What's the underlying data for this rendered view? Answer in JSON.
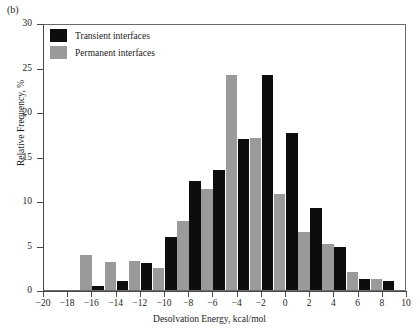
{
  "panel": {
    "label": "(b)"
  },
  "colors": {
    "transient": "#0d0d0d",
    "permanent": "#9a9a9a",
    "axis": "#4a4a4a",
    "frame": "#6b6b6b",
    "background": "#ffffff"
  },
  "legend": {
    "items": [
      {
        "label": "Transient interfaces",
        "color": "#0d0d0d",
        "swatch_name": "legend-swatch-transient"
      },
      {
        "label": "Permanent interfaces",
        "color": "#9a9a9a",
        "swatch_name": "legend-swatch-permanent"
      }
    ]
  },
  "axes": {
    "y": {
      "title": "Relative Frequency, %",
      "ticks": [
        0,
        5,
        10,
        15,
        20,
        25,
        30
      ],
      "tick_labels": [
        "0",
        "5",
        "10",
        "15",
        "20",
        "25",
        "30"
      ],
      "min": 0,
      "max": 30
    },
    "x": {
      "title": "Desolvation Energy, kcal/mol",
      "ticks": [
        -20,
        -18,
        -16,
        -14,
        -12,
        -10,
        -8,
        -6,
        -4,
        -2,
        0,
        2,
        4,
        6,
        8,
        10
      ],
      "tick_labels": [
        "−20",
        "−18",
        "−16",
        "−14",
        "−12",
        "−10",
        "−8",
        "−6",
        "−4",
        "−2",
        "0",
        "2",
        "4",
        "6",
        "8",
        "10"
      ],
      "min": -20,
      "max": 10
    }
  },
  "chart_data": {
    "type": "bar",
    "title": "",
    "subtitle": "",
    "xlabel": "Desolvation Energy, kcal/mol",
    "ylabel": "Relative Frequency, %",
    "xlim": [
      -20,
      10
    ],
    "ylim": [
      0,
      30
    ],
    "grid": false,
    "legend_position": "top-left",
    "bin_width": 2,
    "bin_centers": [
      -19,
      -17,
      -15,
      -13,
      -11,
      -9,
      -7,
      -5,
      -3,
      -1,
      1,
      3,
      5,
      7,
      9
    ],
    "categories": [
      "−20 to −18",
      "−18 to −16",
      "−16 to −14",
      "−14 to −12",
      "−12 to −10",
      "−10 to −8",
      "−8 to −6",
      "−6 to −4",
      "−4 to −2",
      "−2 to 0",
      "0 to 2",
      "2 to 4",
      "4 to 6",
      "6 to 8",
      "8 to 10"
    ],
    "series": [
      {
        "name": "Transient interfaces",
        "color": "#0d0d0d",
        "values": [
          0,
          0,
          0.5,
          1.0,
          3.0,
          6.0,
          12.2,
          13.5,
          17.0,
          24.2,
          17.6,
          9.2,
          4.8,
          1.2,
          1.0
        ]
      },
      {
        "name": "Permanent interfaces",
        "color": "#9a9a9a",
        "values": [
          0,
          3.9,
          3.1,
          3.3,
          2.5,
          7.8,
          11.4,
          24.2,
          17.1,
          10.8,
          6.5,
          5.2,
          2.0,
          1.2,
          0
        ]
      }
    ]
  }
}
